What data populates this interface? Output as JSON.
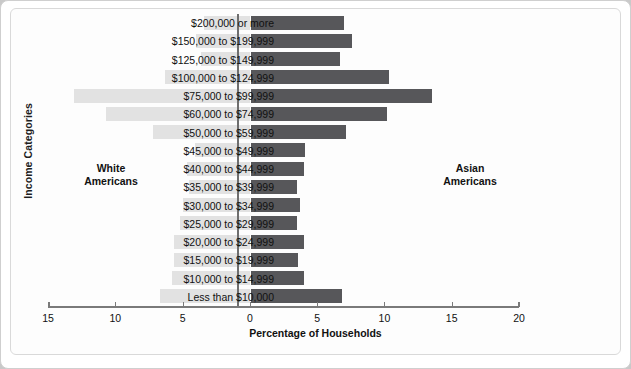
{
  "chart": {
    "type": "bar",
    "orientation": "horizontal-diverging",
    "ylabel": "Income Categories",
    "xlabel": "Percentage of Households",
    "annotations": {
      "left_group_line1": "White",
      "left_group_line2": "Americans",
      "right_group_line1": "Asian",
      "right_group_line2": "Americans"
    },
    "colors": {
      "left_series": "#e2e2e2",
      "right_series": "#57575a",
      "axis": "#7a7a7a",
      "background": "#fdfdfd"
    },
    "axis": {
      "tick_labels": [
        "15",
        "10",
        "5",
        "0",
        "5",
        "10",
        "15",
        "20"
      ],
      "tick_values": [
        -15,
        -10,
        -5,
        0,
        5,
        10,
        15,
        20
      ],
      "xmin": -15,
      "xmax": 20,
      "grid": false
    }
  },
  "chart_data": {
    "type": "bar",
    "title": "",
    "xlabel": "Percentage of Households",
    "ylabel": "Income Categories",
    "xlim": [
      -15,
      20
    ],
    "grid": false,
    "legend_position": "in-plot-annotations",
    "categories": [
      "$200,000 or more",
      "$150,000 to $199,999",
      "$125,000 to $149,999",
      "$100,000 to $124,999",
      "$75,000 to $99,999",
      "$60,000 to $74,999",
      "$50,000 to $59,999",
      "$45,000 to $49,999",
      "$40,000 to $44,999",
      "$35,000 to $39,999",
      "$30,000 to $34,999",
      "$25,000 to $29,999",
      "$20,000 to $24,999",
      "$15,000 to $19,999",
      "$10,000 to $14,999",
      "Less than $10,000"
    ],
    "series": [
      {
        "name": "White Americans",
        "direction": "left",
        "color": "#e2e2e2",
        "values": [
          3.4,
          4.0,
          3.6,
          6.3,
          13.1,
          10.7,
          7.2,
          4.1,
          4.7,
          4.5,
          5.0,
          5.2,
          5.6,
          5.6,
          5.8,
          6.7
        ]
      },
      {
        "name": "Asian Americans",
        "direction": "right",
        "color": "#57575a",
        "values": [
          6.9,
          7.5,
          6.6,
          10.2,
          13.4,
          10.1,
          7.0,
          4.0,
          3.9,
          3.4,
          3.6,
          3.4,
          3.9,
          3.5,
          3.9,
          6.7
        ]
      }
    ]
  }
}
